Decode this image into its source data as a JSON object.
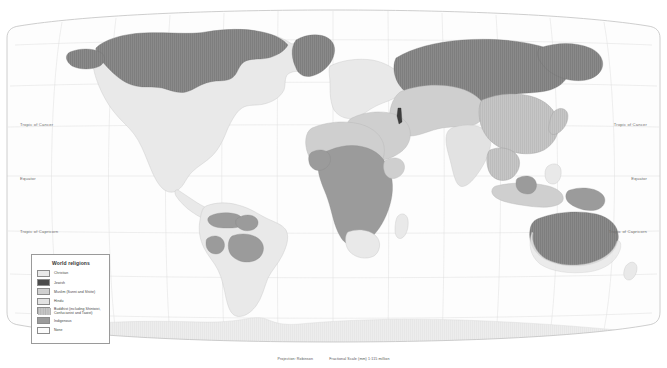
{
  "map": {
    "title": "World religions",
    "graticule_labels": [
      {
        "text": "Tropic of Cancer",
        "side": "left",
        "top": 126
      },
      {
        "text": "Tropic of Cancer",
        "side": "right",
        "top": 126
      },
      {
        "text": "Equator",
        "side": "left",
        "top": 179
      },
      {
        "text": "Equator",
        "side": "right",
        "top": 179
      },
      {
        "text": "Tropic of Capricorn",
        "side": "left",
        "top": 232
      },
      {
        "text": "Tropic of Capricorn",
        "side": "right",
        "top": 232
      }
    ],
    "projection_label": "Projection: Robinson",
    "scale_label": "Fractional Scale (mm) 1:115 million",
    "colors": {
      "ocean": "#ffffff",
      "graticule": "#d8d8d8",
      "coastline": "#bdbdbd",
      "frame": "#c9c9c9",
      "christian": "#e9e9e9",
      "jewish": "#4a4a4a",
      "muslim": "#cfcfcf",
      "hindu": "#e2e2e2",
      "buddhist": "#b8b8b8",
      "indigenous": "#9b9b9b",
      "none": "#7d7d7d",
      "antarctica": "#e4e4e4"
    }
  },
  "legend": {
    "title": "World religions",
    "items": [
      {
        "label": "Christian",
        "color": "#e9e9e9",
        "pattern": "solid"
      },
      {
        "label": "Jewish",
        "color": "#4a4a4a",
        "pattern": "solid"
      },
      {
        "label": "Muslim (Sunni and Shiite)",
        "color": "#cfcfcf",
        "pattern": "solid"
      },
      {
        "label": "Hindu",
        "color": "#e2e2e2",
        "pattern": "solid"
      },
      {
        "label": "Buddhist (including Shintoist, Confucianist and Taoist)",
        "color": "#b8b8b8",
        "pattern": "hatch"
      },
      {
        "label": "Indigenous",
        "color": "#9b9b9b",
        "pattern": "solid"
      },
      {
        "label": "None",
        "color": "#fbfbfb",
        "pattern": "solid"
      }
    ]
  }
}
